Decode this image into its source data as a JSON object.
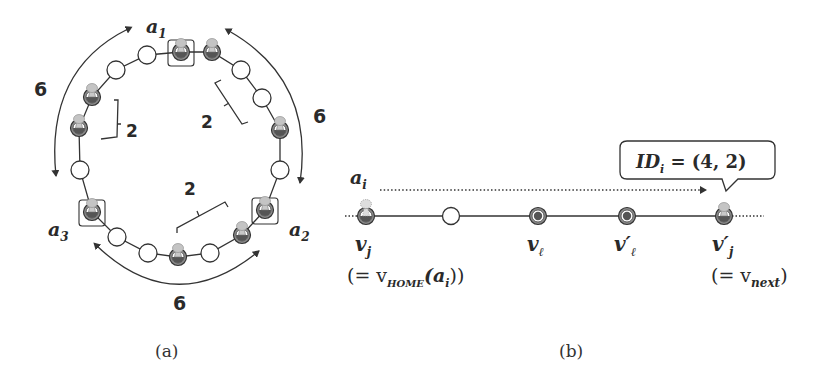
{
  "panel_a": {
    "caption": "(a)",
    "agents": [
      {
        "label": "a",
        "sub": "1"
      },
      {
        "label": "a",
        "sub": "2"
      },
      {
        "label": "a",
        "sub": "3"
      }
    ],
    "distance_labels": [
      "6",
      "6",
      "6"
    ],
    "bracket_labels": [
      "2",
      "2",
      "2"
    ],
    "ring_nodes": [
      {
        "x": 181,
        "y": 52,
        "type": "agent",
        "boxed": true
      },
      {
        "x": 212,
        "y": 52,
        "type": "agent",
        "boxed": false
      },
      {
        "x": 241,
        "y": 70,
        "type": "empty"
      },
      {
        "x": 262,
        "y": 98,
        "type": "empty"
      },
      {
        "x": 280,
        "y": 130,
        "type": "agent",
        "boxed": false
      },
      {
        "x": 280,
        "y": 170,
        "type": "empty"
      },
      {
        "x": 265,
        "y": 210,
        "type": "agent",
        "boxed": true
      },
      {
        "x": 242,
        "y": 235,
        "type": "agent",
        "boxed": false
      },
      {
        "x": 210,
        "y": 253,
        "type": "empty"
      },
      {
        "x": 178,
        "y": 257,
        "type": "agent",
        "boxed": false
      },
      {
        "x": 148,
        "y": 253,
        "type": "empty"
      },
      {
        "x": 117,
        "y": 237,
        "type": "empty"
      },
      {
        "x": 92,
        "y": 212,
        "type": "agent",
        "boxed": true
      },
      {
        "x": 80,
        "y": 170,
        "type": "empty"
      },
      {
        "x": 79,
        "y": 128,
        "type": "agent",
        "boxed": false
      },
      {
        "x": 92,
        "y": 97,
        "type": "agent",
        "boxed": false
      },
      {
        "x": 116,
        "y": 70,
        "type": "empty"
      },
      {
        "x": 147,
        "y": 55,
        "type": "empty"
      }
    ]
  },
  "panel_b": {
    "caption": "(b)",
    "agent_label": {
      "label": "a",
      "sub": "i"
    },
    "callout": {
      "text": "ID",
      "sub": "i",
      "value": " = (4, 2)"
    },
    "nodes": [
      {
        "label": "v",
        "sub": "j",
        "note": "(= v",
        "note_sub": "HOME",
        "note_tail": "(a",
        "note_tail_sub": "i",
        "note_end": "))"
      },
      {
        "label": "",
        "sub": ""
      },
      {
        "label": "v",
        "sub": "ℓ"
      },
      {
        "label": "v′",
        "sub": "ℓ"
      },
      {
        "label": "v′",
        "sub": "j",
        "note": "(= v",
        "note_sub": "next",
        "note_end": ")"
      }
    ]
  }
}
